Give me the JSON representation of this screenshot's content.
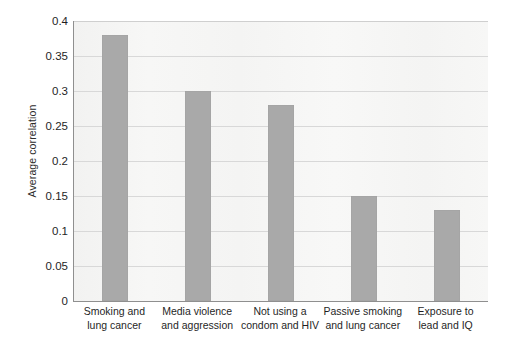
{
  "chart_data": {
    "type": "bar",
    "title": "",
    "subtitle": "",
    "xlabel": "",
    "ylabel": "Average correlation",
    "ylim": [
      0,
      0.4
    ],
    "yticks": [
      "0",
      "0.05",
      "0.1",
      "0.15",
      "0.2",
      "0.25",
      "0.3",
      "0.35",
      "0.4"
    ],
    "ytick_values": [
      0,
      0.05,
      0.1,
      0.15,
      0.2,
      0.25,
      0.3,
      0.35,
      0.4
    ],
    "grid": true,
    "legend": "none",
    "bar_color": "#a9a9a9",
    "plot_background": "#f6f6f5",
    "axis_color": "#8f8f8f",
    "categories": [
      "Smoking and lung cancer",
      "Media violence and aggression",
      "Not using a condom and HIV",
      "Passive smoking and lung cancer",
      "Exposure to lead and IQ"
    ],
    "category_lines": [
      [
        "Smoking and",
        "lung cancer"
      ],
      [
        "Media violence",
        "and aggression"
      ],
      [
        "Not using a",
        "condom and HIV"
      ],
      [
        "Passive smoking",
        "and lung cancer"
      ],
      [
        "Exposure to",
        "lead and IQ"
      ]
    ],
    "values": [
      0.38,
      0.3,
      0.28,
      0.15,
      0.13
    ]
  }
}
